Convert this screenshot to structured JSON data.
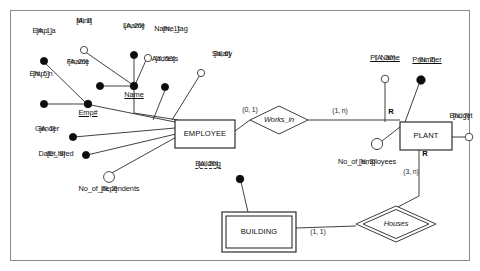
{
  "diagram": {
    "notation": "Chen-style ER with (min, max) cardinalities and [type, size] attribute annotations"
  },
  "entities": [
    {
      "id": "employee",
      "label": "EMPLOYEE",
      "kind": "strong-entity",
      "x": 175,
      "y": 120,
      "w": 60,
      "h": 28
    },
    {
      "id": "plant",
      "label": "PLANT",
      "kind": "strong-entity",
      "x": 400,
      "y": 122,
      "w": 52,
      "h": 28
    },
    {
      "id": "building",
      "label": "BUILDING",
      "kind": "weak-entity",
      "x": 222,
      "y": 217,
      "w": 74,
      "h": 36
    }
  ],
  "relationships": [
    {
      "id": "works_in",
      "label": "Works_in",
      "kind": "relationship",
      "x": 279,
      "y": 120
    },
    {
      "id": "houses",
      "label": "Houses",
      "kind": "identifying-relationship",
      "x": 396,
      "y": 224
    }
  ],
  "cardinalities": [
    {
      "id": "employee-works_in",
      "label": "(0, 1)"
    },
    {
      "id": "works_in-plant",
      "label": "(1, n)"
    },
    {
      "id": "plant-houses",
      "label": "(3, n)"
    },
    {
      "id": "building-houses",
      "label": "(1, 1)"
    }
  ],
  "role_markers": [
    {
      "id": "plant-works_in-R",
      "label": "R"
    },
    {
      "id": "plant-houses-R",
      "label": "R"
    }
  ],
  "attributes": {
    "employee": [
      {
        "id": "emp_a",
        "name": "Emp_a",
        "type": "[A, 1]",
        "circle": "filled",
        "key": false
      },
      {
        "id": "minit",
        "name": "Minit",
        "type": "[A, 1]",
        "circle": "open",
        "key": false
      },
      {
        "id": "lname",
        "name": "Lname",
        "type": "[A, 20]",
        "circle": "filled",
        "key": false
      },
      {
        "id": "name_tag",
        "name": "Name_tag",
        "type": "[N, 1]",
        "circle": "open",
        "key": false
      },
      {
        "id": "address",
        "name": "Address",
        "type": "[X, 50]",
        "circle": "filled",
        "key": false
      },
      {
        "id": "salary",
        "name": "Salary",
        "type": "[N, 6]",
        "circle": "open",
        "key": false
      },
      {
        "id": "fname",
        "name": "Fname",
        "type": "[A, 20]",
        "circle": "filled",
        "key": false
      },
      {
        "id": "name",
        "name": "Name",
        "type": "",
        "circle": "filled",
        "key": true
      },
      {
        "id": "emp_n",
        "name": "Emp_n",
        "type": "[N, 5]",
        "circle": "filled",
        "key": false
      },
      {
        "id": "emp_num",
        "name": "Emp#",
        "type": "",
        "circle": "filled",
        "key": true
      },
      {
        "id": "gender",
        "name": "Gender",
        "type": "[A, 1]",
        "circle": "filled",
        "key": false
      },
      {
        "id": "date_hired",
        "name": "Date_hired",
        "type": "[Dt, 8]",
        "circle": "filled",
        "key": false
      },
      {
        "id": "no_of_dependents",
        "name": "No_of_dependents",
        "type": "[N, 2]",
        "circle": "open",
        "key": false
      }
    ],
    "plant": [
      {
        "id": "pl_name",
        "name": "Pl_Name",
        "type": "[A, 30]",
        "circle": "open",
        "key": true
      },
      {
        "id": "pnumber",
        "name": "Pnumber",
        "type": "[N, 2]",
        "circle": "filled",
        "key": true
      },
      {
        "id": "budget",
        "name": "Budget",
        "type": "[N, 7]",
        "circle": "open",
        "key": false
      },
      {
        "id": "no_of_employees",
        "name": "No_of_employees",
        "type": "[N, 3]",
        "circle": "open",
        "key": false
      }
    ],
    "building": [
      {
        "id": "building_attr",
        "name": "Building",
        "type": "[A, 20]",
        "circle": "filled",
        "key": "partial"
      }
    ]
  },
  "colors": {
    "ink": "#111111",
    "line": "#2b2b2b",
    "frame": "#8c8c8c",
    "fill": "#ffffff"
  }
}
